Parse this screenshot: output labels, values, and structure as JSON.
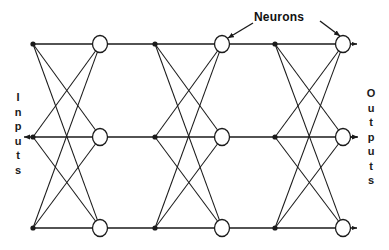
{
  "figure": {
    "type": "neural-network-diagram",
    "title": "",
    "background_color": "#ffffff",
    "stroke_color": "#1a1a1a",
    "node_fill_color": "#ffffff",
    "width": 389,
    "height": 250
  },
  "labels": {
    "neurons": "Neurons",
    "inputs": "Inputs",
    "outputs": "Outputs",
    "inputs_letters": [
      "I",
      "n",
      "p",
      "u",
      "t",
      "s"
    ],
    "outputs_letters": [
      "O",
      "u",
      "t",
      "p",
      "u",
      "t",
      "s"
    ]
  },
  "chart_data": {
    "type": "diagram",
    "rows": 3,
    "columns": 3,
    "row_y": [
      44,
      137,
      228
    ],
    "junction_x": [
      33,
      155,
      275
    ],
    "neuron_x": [
      100,
      222,
      343
    ],
    "neuron_rx": 7.5,
    "neuron_ry": 8.5,
    "junction_dot_r": 2.6,
    "connections_per_junction": 3,
    "total_neurons": 9,
    "total_junctions": 9,
    "output_arrow_end_x": 357
  },
  "annotations": [
    {
      "name": "neurons-callout",
      "text": "Neurons",
      "text_x": 254,
      "text_y": 10,
      "arrows": [
        {
          "name": "neurons-arrow-left",
          "x1": 253,
          "y1": 23,
          "x2": 228,
          "y2": 38
        },
        {
          "name": "neurons-arrow-right",
          "x1": 320,
          "y1": 21,
          "x2": 340,
          "y2": 36
        }
      ]
    },
    {
      "name": "inputs-callout",
      "text": "Inputs",
      "arrow": {
        "name": "inputs-arrow",
        "x1": 31,
        "y1": 137,
        "x2": 24,
        "y2": 137
      }
    },
    {
      "name": "outputs-callout",
      "text": "Outputs",
      "arrow": {
        "name": "outputs-arrow",
        "x1": 351,
        "y1": 137,
        "x2": 358,
        "y2": 137
      }
    }
  ]
}
